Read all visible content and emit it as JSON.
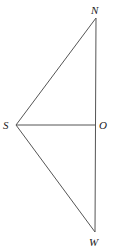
{
  "diagram": {
    "points": {
      "N": {
        "label": "N",
        "x": 96,
        "y": 18
      },
      "S": {
        "label": "S",
        "x": 16,
        "y": 125
      },
      "O": {
        "label": "O",
        "x": 96,
        "y": 125
      },
      "W": {
        "label": "W",
        "x": 95,
        "y": 232
      }
    },
    "segments": [
      "SN",
      "NO",
      "OW",
      "SO",
      "SW"
    ],
    "line_color": "#555555"
  }
}
